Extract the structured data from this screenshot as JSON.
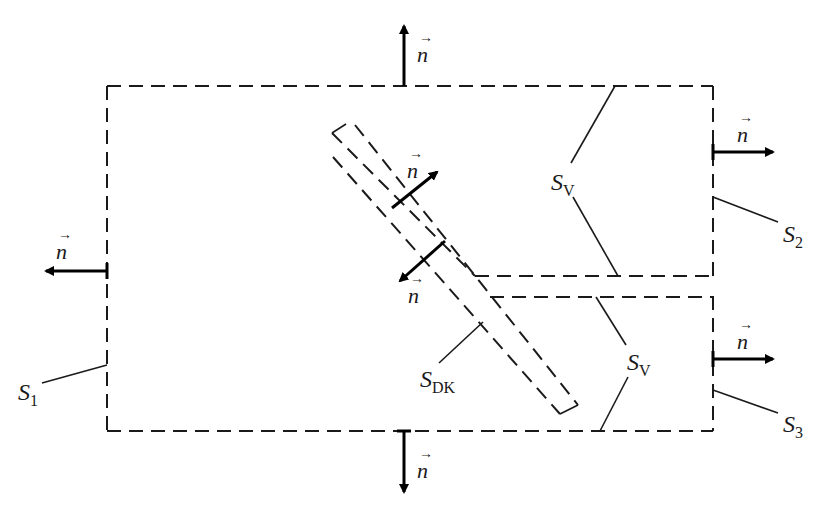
{
  "figure": {
    "normal_symbol": "n",
    "vector_arrow": "→"
  },
  "labels": {
    "s1": {
      "base": "S",
      "sub": "1"
    },
    "s2": {
      "base": "S",
      "sub": "2"
    },
    "s3": {
      "base": "S",
      "sub": "3"
    },
    "sv_top": {
      "base": "S",
      "sub": "V"
    },
    "sv_bottom": {
      "base": "S",
      "sub": "V"
    },
    "sdk": {
      "base": "S",
      "sub": "DK"
    }
  },
  "normals": [
    {
      "id": "top",
      "direction": "up"
    },
    {
      "id": "bottom",
      "direction": "down"
    },
    {
      "id": "left",
      "direction": "left"
    },
    {
      "id": "right-upper",
      "direction": "right"
    },
    {
      "id": "right-lower",
      "direction": "right"
    },
    {
      "id": "channel-upper",
      "direction": "up-right"
    },
    {
      "id": "channel-lower",
      "direction": "down-left"
    }
  ],
  "colors": {
    "stroke": "#1a1a1a",
    "background": "#ffffff"
  }
}
